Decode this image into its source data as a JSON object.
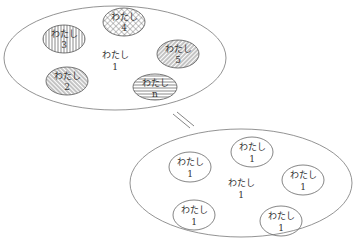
{
  "top_group": {
    "center_label": "わたし",
    "center_number": "1",
    "members": [
      {
        "label": "わたし",
        "number": "3",
        "pattern": "vertical-lines"
      },
      {
        "label": "わたし",
        "number": "4",
        "pattern": "crosshatch"
      },
      {
        "label": "わたし",
        "number": "5",
        "pattern": "diagonal-lines"
      },
      {
        "label": "わたし",
        "number": "2",
        "pattern": "back-diagonal-lines"
      },
      {
        "label": "わたし",
        "number": "n",
        "pattern": "horizontal-lines"
      }
    ]
  },
  "equals_sign": "=",
  "bottom_group": {
    "center_label": "わたし",
    "center_number": "1",
    "members": [
      {
        "label": "わたし",
        "number": "1"
      },
      {
        "label": "わたし",
        "number": "1"
      },
      {
        "label": "わたし",
        "number": "1"
      },
      {
        "label": "わたし",
        "number": "1"
      },
      {
        "label": "わたし",
        "number": "1"
      }
    ]
  }
}
